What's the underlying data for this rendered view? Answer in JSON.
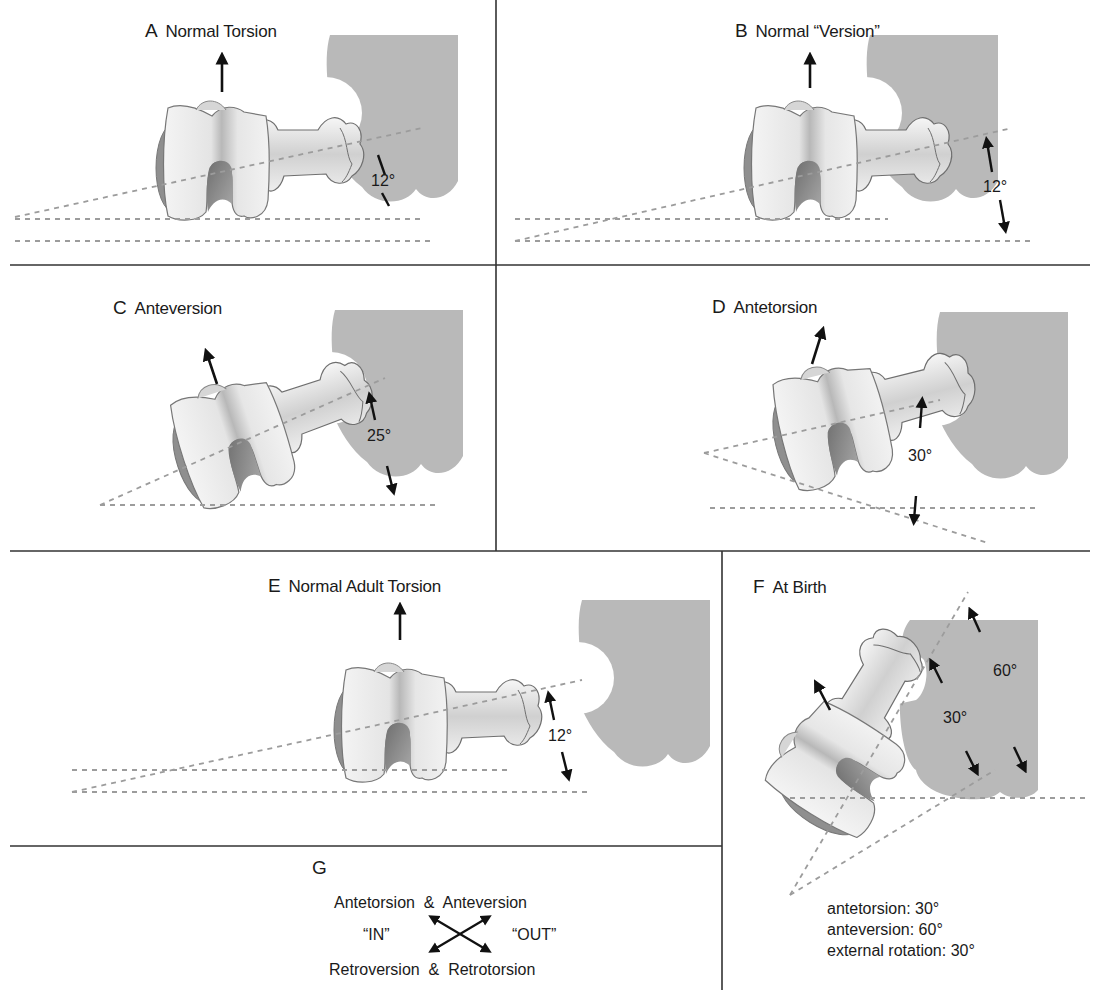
{
  "colors": {
    "pelvis": "#b9b9b9",
    "bone_fill": "#eeeeee",
    "bone_shade": "#9a9a9a",
    "dashes": "#9c9c9c",
    "rule": "#333333",
    "text": "#1a1a1a"
  },
  "panels": [
    {
      "letter": "A",
      "title": "Normal Torsion",
      "angle": "12°"
    },
    {
      "letter": "B",
      "title": "Normal “Version”",
      "angle": "12°"
    },
    {
      "letter": "C",
      "title": "Anteversion",
      "angle": "25°"
    },
    {
      "letter": "D",
      "title": "Antetorsion",
      "angle": "30°"
    },
    {
      "letter": "E",
      "title": "Normal Adult Torsion",
      "angle": "12°"
    },
    {
      "letter": "F",
      "title": "At Birth",
      "angles": [
        "60°",
        "30°"
      ],
      "summary": [
        "antetorsion: 30°",
        "anteversion: 60°",
        "external rotation: 30°"
      ]
    },
    {
      "letter": "G",
      "top_line": "Antetorsion  &  Anteversion",
      "left_word": "“IN”",
      "right_word": "“OUT”",
      "bottom_line": "Retroversion  &  Retrotorsion"
    }
  ]
}
